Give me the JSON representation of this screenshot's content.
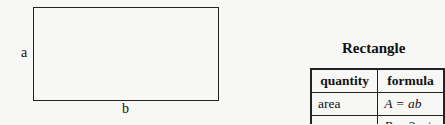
{
  "diagram": {
    "side_a": "a",
    "side_b": "b"
  },
  "table": {
    "title": "Rectangle",
    "headers": [
      "quantity",
      "formula"
    ],
    "rows": [
      {
        "quantity": "area",
        "formula": "A = ab"
      },
      {
        "quantity": "perimeter",
        "formula": "P = 2a + 2b"
      }
    ]
  }
}
